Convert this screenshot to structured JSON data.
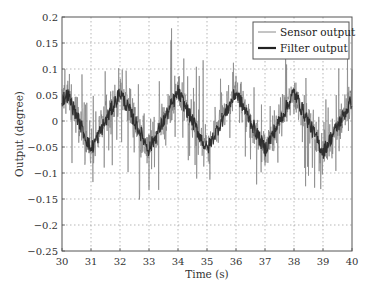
{
  "chart_data": {
    "type": "line",
    "title": "",
    "xlabel": "Time (s)",
    "ylabel": "Output (degree)",
    "xlim": [
      30,
      40
    ],
    "ylim": [
      -0.25,
      0.2
    ],
    "xticks": [
      30,
      31,
      32,
      33,
      34,
      35,
      36,
      37,
      38,
      39,
      40
    ],
    "yticks": [
      0.2,
      0.15,
      0.1,
      0.05,
      0,
      -0.05,
      -0.1,
      -0.15,
      -0.2,
      -0.25
    ],
    "ytick_labels": [
      "0.2",
      "0.15",
      "0.1",
      "0.05",
      "0",
      "−0.05",
      "−0.1",
      "−0.15",
      "−0.2",
      "−0.25"
    ],
    "grid": true,
    "legend_position": "upper right",
    "series": [
      {
        "name": "Sensor output",
        "color": "#7a7a7a",
        "style": "thin noisy line",
        "description": "Noisy measurement around the filter output, spikes reaching about +0.19 and down to about -0.23",
        "noise_amplitude": 0.045,
        "spike_amplitude": 0.12,
        "sample_count": 900
      },
      {
        "name": "Filter output",
        "color": "#222222",
        "style": "thick line",
        "x": [
          30,
          30.2,
          31.0,
          32.0,
          33.0,
          34.0,
          35.0,
          36.0,
          37.0,
          38.0,
          39.0,
          40.0
        ],
        "values": [
          0.04,
          0.05,
          -0.055,
          0.055,
          -0.055,
          0.055,
          -0.055,
          0.055,
          -0.055,
          0.055,
          -0.06,
          0.04
        ]
      }
    ],
    "annotations": []
  },
  "legend": {
    "items": [
      {
        "label": "Sensor output",
        "color": "#8a8a8a"
      },
      {
        "label": "Filter output",
        "color": "#222222"
      }
    ]
  }
}
